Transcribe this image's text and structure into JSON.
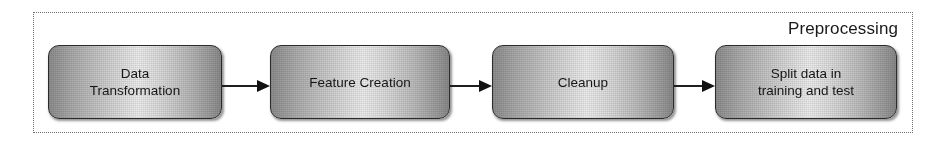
{
  "diagram": {
    "group": {
      "title": "Preprocessing",
      "border_style": "dotted",
      "border_color": "#6f6f6f"
    },
    "nodes": [
      {
        "id": "node-1",
        "label": "Data\nTransformation"
      },
      {
        "id": "node-2",
        "label": "Feature Creation"
      },
      {
        "id": "node-3",
        "label": "Cleanup"
      },
      {
        "id": "node-4",
        "label": "Split data in\ntraining and test"
      }
    ],
    "connectors": [
      {
        "id": "arrow-1",
        "from": "node-1",
        "to": "node-2",
        "style": "solid-arrow"
      },
      {
        "id": "arrow-2",
        "from": "node-2",
        "to": "node-3",
        "style": "solid-arrow"
      },
      {
        "id": "arrow-3",
        "from": "node-3",
        "to": "node-4",
        "style": "solid-arrow"
      }
    ],
    "colors": {
      "node_fill_light": "#ededed",
      "node_fill_dark": "#8a8a8a",
      "node_border": "#2b2b2b",
      "arrow": "#111111",
      "text": "#161616",
      "background": "#ffffff"
    }
  }
}
